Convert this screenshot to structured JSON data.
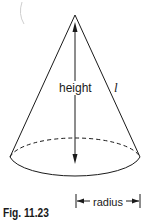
{
  "figure": {
    "caption": "Fig. 11.23",
    "shape": "cone",
    "labels": {
      "height": "height",
      "slant_height": "l",
      "radius": "radius"
    },
    "colors": {
      "stroke": "#1a1a1a",
      "background": "#ffffff"
    }
  }
}
